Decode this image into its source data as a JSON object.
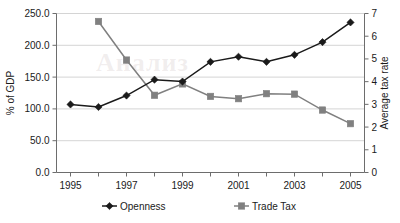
{
  "chart_data": {
    "type": "line",
    "title": "",
    "subtitle": "",
    "xlabel": "",
    "ylabel": "% of GDP",
    "y2label": "Average tax rate",
    "grid": true,
    "legend_position": "bottom",
    "x": [
      1995,
      1996,
      1997,
      1998,
      1999,
      2000,
      2001,
      2002,
      2003,
      2004,
      2005
    ],
    "xlim": [
      1994.5,
      2005.5
    ],
    "xticks_major": [
      "1995",
      "1997",
      "1999",
      "2001",
      "2003",
      "2005"
    ],
    "xticks_major_values": [
      1995,
      1997,
      1999,
      2001,
      2003,
      2005
    ],
    "xticks_minor_values": [
      1996,
      1998,
      2000,
      2002,
      2004
    ],
    "ylim": [
      0.0,
      250.0
    ],
    "yticks": [
      "0.0",
      "50.0",
      "100.0",
      "150.0",
      "200.0",
      "250.0"
    ],
    "ytick_values": [
      0,
      50,
      100,
      150,
      200,
      250
    ],
    "y2lim": [
      0,
      7
    ],
    "y2ticks": [
      "0",
      "1",
      "2",
      "3",
      "4",
      "5",
      "6",
      "7"
    ],
    "y2tick_values": [
      0,
      1,
      2,
      3,
      4,
      5,
      6,
      7
    ],
    "series": [
      {
        "name": "Openness",
        "axis": "left",
        "marker": "diamond",
        "color": "#1a1a1a",
        "x": [
          1995,
          1996,
          1997,
          1998,
          1999,
          2000,
          2001,
          2002,
          2003,
          2004,
          2005
        ],
        "values": [
          107,
          103,
          121,
          146,
          143,
          174,
          182,
          174,
          185,
          205,
          236
        ]
      },
      {
        "name": "Trade Tax",
        "axis": "right",
        "marker": "square",
        "color": "#808080",
        "x": [
          1996,
          1997,
          1998,
          1999,
          2000,
          2001,
          2002,
          2003,
          2004,
          2005
        ],
        "values": [
          6.65,
          4.95,
          3.4,
          3.9,
          3.35,
          3.25,
          3.47,
          3.45,
          2.75,
          2.15
        ]
      }
    ]
  },
  "axes": {
    "left_title": "% of GDP",
    "right_title": "Average tax rate"
  },
  "legend": {
    "items": [
      {
        "label": "Openness",
        "marker": "diamond",
        "color": "#1a1a1a"
      },
      {
        "label": "Trade Tax",
        "marker": "square",
        "color": "#808080"
      }
    ]
  },
  "watermark": {
    "text": "Анализ"
  },
  "colors": {
    "openness": "#1a1a1a",
    "trade_tax": "#808080",
    "gridline": "#c9c9c9",
    "axis": "#6d6d6d",
    "background": "#ffffff"
  }
}
